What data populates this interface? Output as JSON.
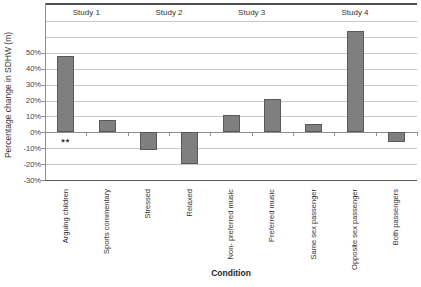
{
  "chart_data": {
    "type": "bar",
    "title": "",
    "ylabel": "Percentage change in SDHW (m)",
    "xlabel": "Condition",
    "categories": [
      "Arguing children",
      "Sports commentary",
      "Stressed",
      "Relaxed",
      "Non- preferred music",
      "Preferred music",
      "Same sex passenger",
      "Opposite sex passenger",
      "Both passengers"
    ],
    "values": [
      48,
      8,
      -11,
      -20,
      11,
      21,
      5,
      64,
      -6
    ],
    "groups": [
      {
        "label": "Study 1",
        "start": 0,
        "end": 1
      },
      {
        "label": "Study 2",
        "start": 2,
        "end": 3
      },
      {
        "label": "Study 3",
        "start": 4,
        "end": 5
      },
      {
        "label": "Study 4",
        "start": 6,
        "end": 8
      }
    ],
    "annotations": [
      {
        "text": "**",
        "category_index": 0,
        "position": "below-axis"
      }
    ],
    "ylim": [
      -30,
      81
    ],
    "yticks": [
      50,
      40,
      30,
      20,
      10,
      0,
      -10,
      -20,
      -30
    ],
    "ytick_labels": [
      "50%",
      "40%",
      "30%",
      "20%",
      "10%",
      "0%",
      "-10%",
      "-20%",
      "-30%"
    ],
    "gridline_values": [
      70,
      60,
      50,
      40,
      30,
      20,
      10,
      0,
      -10,
      -20,
      -30
    ],
    "grid": "on",
    "legend": "none",
    "colors": {
      "bar_fill": "#7f7f7f",
      "bar_border": "#595959",
      "gridline": "#c8c8c8",
      "axis_line": "#8f8f8f",
      "chart_border": "#4d4d4d",
      "text": "#333333",
      "background": "#ffffff"
    }
  }
}
